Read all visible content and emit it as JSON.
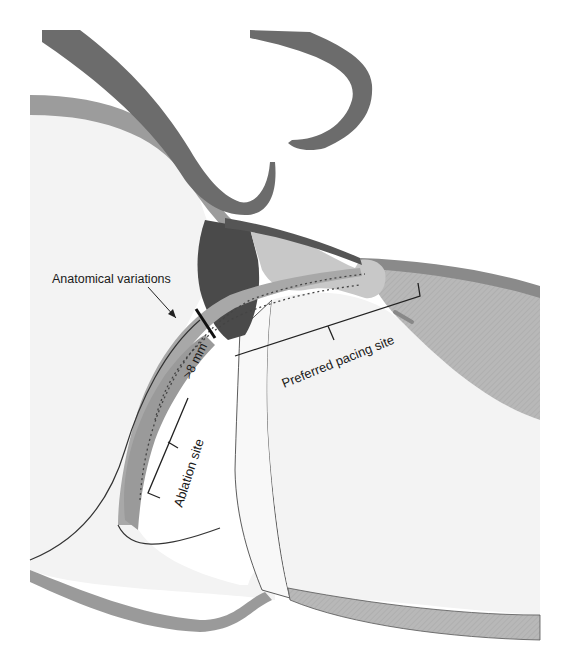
{
  "diagram": {
    "type": "anatomical-illustration",
    "labels": {
      "anatomical_variations": "Anatomical variations",
      "distance": ">8 mm",
      "preferred_pacing_site": "Preferred pacing site",
      "ablation_site": "Ablation site"
    },
    "colors": {
      "background": "#ffffff",
      "chamber_fill": "#f3f3f3",
      "wall_medium": "#9a9a9a",
      "wall_dark": "#6e6e6e",
      "tissue_darkest": "#4a4a4a",
      "tissue_light": "#c8c8c8",
      "hatched_wall": "#b4b4b4",
      "outline": "#2a2a2a"
    }
  }
}
